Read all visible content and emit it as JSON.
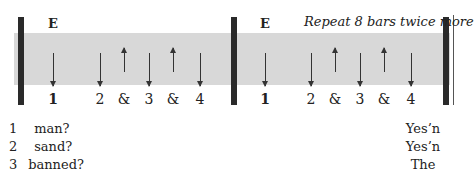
{
  "measures": [
    {
      "chord": "E",
      "counts": [
        "1",
        "2",
        "&",
        "3",
        "&",
        "4"
      ],
      "strums": [
        "down",
        "down",
        "up",
        "down",
        "up",
        "down"
      ]
    },
    {
      "chord": "E",
      "counts": [
        "1",
        "2",
        "&",
        "3",
        "&",
        "4"
      ],
      "strums": [
        "down",
        "down",
        "up",
        "down",
        "up",
        "down"
      ]
    }
  ],
  "repeat_instruction": "Repeat 8 bars twice more",
  "lyrics": [
    {
      "num": "1",
      "text": "man?"
    },
    {
      "num": "2",
      "text": "sand?"
    },
    {
      "num": "3",
      "text": "banned?"
    }
  ],
  "answers": [
    "Yes’n",
    "Yes’n",
    "The"
  ]
}
